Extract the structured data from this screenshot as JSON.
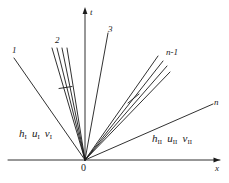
{
  "figure": {
    "type": "characteristics-diagram",
    "axes": {
      "x_label": "x",
      "t_label": "t",
      "origin_label": "0"
    },
    "line_labels": {
      "first": "1",
      "second": "2",
      "third": "3",
      "penultimate": "n-1",
      "last": "n"
    },
    "regions": {
      "left": {
        "h": "h",
        "h_sub": "I",
        "u": "u",
        "u_sub": "I",
        "v": "v",
        "v_sub": "I"
      },
      "right": {
        "h": "h",
        "h_sub": "II",
        "u": "u",
        "u_sub": "II",
        "v": "v",
        "v_sub": "II"
      }
    },
    "colors": {
      "stroke": "#1a1a1a",
      "background": "#ffffff"
    }
  }
}
